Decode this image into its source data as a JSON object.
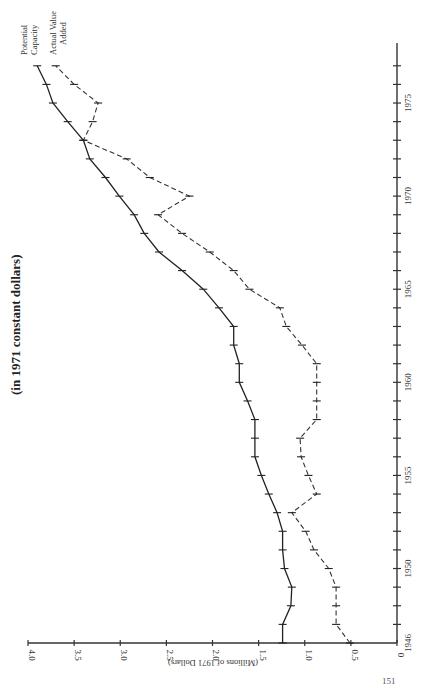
{
  "chart_data": {
    "type": "line",
    "title": "(in 1971 constant dollars)",
    "orientation": "rotated 90 degrees (years run bottom-to-top on the right, values run right-to-left along the bottom)",
    "xlabel": "Year",
    "ylabel": "(Millions of 1971 Dollars)",
    "ylim": [
      0,
      4.0
    ],
    "xlim": [
      1946,
      1978
    ],
    "y_ticks": [
      "0",
      "0.5",
      "1.0",
      "1.5",
      "2.0",
      "2.5",
      "3.0",
      "3.5",
      "4.0"
    ],
    "x_tick_labels": [
      "1946",
      "1950",
      "1955",
      "1960",
      "1965",
      "1970",
      "1975"
    ],
    "grid": false,
    "x": [
      1946,
      1947,
      1948,
      1949,
      1950,
      1951,
      1952,
      1953,
      1954,
      1955,
      1956,
      1957,
      1958,
      1959,
      1960,
      1961,
      1962,
      1963,
      1964,
      1965,
      1966,
      1967,
      1968,
      1969,
      1970,
      1971,
      1972,
      1973,
      1974,
      1975,
      1976,
      1977
    ],
    "series": [
      {
        "name": "Potential Capacity",
        "style": "solid",
        "values": [
          1.24,
          1.24,
          1.15,
          1.14,
          1.22,
          1.24,
          1.24,
          1.3,
          1.39,
          1.47,
          1.54,
          1.54,
          1.54,
          1.62,
          1.71,
          1.71,
          1.77,
          1.77,
          1.93,
          2.1,
          2.33,
          2.58,
          2.74,
          2.85,
          3.01,
          3.16,
          3.33,
          3.4,
          3.57,
          3.73,
          3.8,
          3.9
        ]
      },
      {
        "name": "Actual Value Added",
        "style": "dashed",
        "values": [
          0.51,
          0.66,
          0.66,
          0.66,
          0.74,
          0.9,
          0.99,
          1.14,
          0.87,
          0.96,
          1.04,
          1.05,
          0.87,
          0.87,
          0.87,
          0.87,
          1.03,
          1.2,
          1.27,
          1.6,
          1.77,
          2.03,
          2.33,
          2.59,
          2.25,
          2.68,
          2.93,
          3.4,
          3.3,
          3.24,
          3.5,
          3.7
        ]
      }
    ],
    "legend": [
      "Potential Capacity",
      "Actual Value Added"
    ],
    "legend_position": "annotations at line ends (top)"
  },
  "labels": {
    "title": "(in 1971 constant dollars)",
    "value_axis_title": "(Millions of 1971 Dollars)",
    "legend_potential_line1": "Potential",
    "legend_potential_line2": "Capacity",
    "legend_actual_line1": "Actual Value",
    "legend_actual_line2": "Added",
    "page_number": "151"
  }
}
